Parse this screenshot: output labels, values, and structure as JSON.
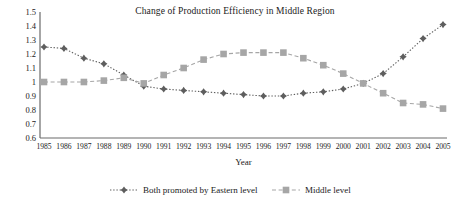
{
  "chart_data": {
    "type": "line",
    "title": "Change of Production Efficiency in Middle Region",
    "xlabel": "Year",
    "ylabel": "",
    "categories": [
      "1985",
      "1986",
      "1987",
      "1988",
      "1989",
      "1990",
      "1991",
      "1992",
      "1993",
      "1994",
      "1995",
      "1996",
      "1997",
      "1998",
      "1999",
      "2000",
      "2001",
      "2002",
      "2003",
      "2004",
      "2005"
    ],
    "ylim": [
      0.6,
      1.5
    ],
    "yticks": [
      "1.5",
      "1.4",
      "1.3",
      "1.2",
      "1.1",
      "1",
      "0.9",
      "0.8",
      "0.7",
      "0.6"
    ],
    "ytick_values": [
      1.5,
      1.4,
      1.3,
      1.2,
      1.1,
      1.0,
      0.9,
      0.8,
      0.7,
      0.6
    ],
    "grid": false,
    "legend_position": "bottom",
    "series": [
      {
        "name": "Both promoted by Eastern level",
        "marker": "diamond",
        "color": "#5e5e5e",
        "linestyle": "dotted",
        "values": [
          1.25,
          1.24,
          1.17,
          1.13,
          1.05,
          0.97,
          0.95,
          0.94,
          0.93,
          0.92,
          0.91,
          0.9,
          0.9,
          0.92,
          0.93,
          0.95,
          0.99,
          1.06,
          1.18,
          1.31,
          1.41
        ]
      },
      {
        "name": "Middle level",
        "marker": "square",
        "color": "#a6a6a6",
        "linestyle": "dashed",
        "values": [
          1.0,
          1.0,
          1.0,
          1.01,
          1.03,
          0.99,
          1.05,
          1.1,
          1.16,
          1.2,
          1.21,
          1.21,
          1.21,
          1.17,
          1.12,
          1.06,
          0.99,
          0.92,
          0.85,
          0.84,
          0.81
        ]
      }
    ]
  },
  "legend": {
    "items": [
      {
        "label": "Both promoted by Eastern level"
      },
      {
        "label": "Middle level"
      }
    ]
  }
}
